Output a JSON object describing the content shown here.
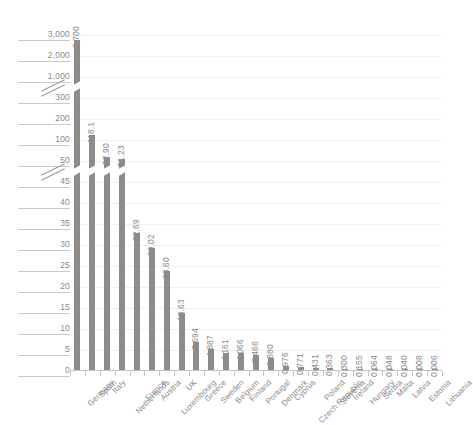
{
  "chart_data": {
    "type": "bar",
    "title": "",
    "subtitle": "",
    "xlabel": "",
    "ylabel": "",
    "grid": true,
    "legend": null,
    "axis_breaks": [
      {
        "between": [
          45,
          50
        ],
        "marker": "double-slash"
      },
      {
        "between": [
          300,
          1000
        ],
        "marker": "double-slash"
      }
    ],
    "ylim": [
      0,
      3000
    ],
    "ytick_labels": [
      "0",
      "5",
      "10",
      "15",
      "20",
      "25",
      "30",
      "35",
      "40",
      "45",
      "50",
      "100",
      "200",
      "300",
      "1,000",
      "2,000",
      "3,000"
    ],
    "ytick_values": [
      0,
      5,
      10,
      15,
      20,
      25,
      30,
      35,
      40,
      45,
      50,
      100,
      200,
      300,
      1000,
      2000,
      3000
    ],
    "categories": [
      "Germany",
      "Spain",
      "Italy",
      "Netherlands",
      "France",
      "Austria",
      "Luxembourg",
      "UK",
      "Greece",
      "Sweden",
      "Belgium",
      "Finland",
      "Portugal",
      "Denmark",
      "Cyprus",
      "Czech Republic",
      "Poland",
      "Slovenia",
      "Ireland",
      "Hungary",
      "Serbia",
      "Malta",
      "Latvia",
      "Estonia",
      "Lithuania"
    ],
    "values": [
      2700,
      118.1,
      57.9,
      51.23,
      32.69,
      29.02,
      23.6,
      13.63,
      6.694,
      4.887,
      4.161,
      4.066,
      3.466,
      2.88,
      0.976,
      0.771,
      0.431,
      0.363,
      0.3,
      0.155,
      0.064,
      0.048,
      0.04,
      0.008,
      0.006
    ],
    "value_labels": [
      "2,700",
      "118.1",
      "57.90",
      "51.23",
      "32.69",
      "29.02",
      "23.60",
      "13.63",
      "6.694",
      "4.887",
      "4.161",
      "4.066",
      "3.466",
      "2.880",
      "0.976",
      "0.771",
      "0.431",
      "0.363",
      "0.300",
      "0.155",
      "0.064",
      "0.048",
      "0.040",
      "0.008",
      "0.006"
    ],
    "colors": {
      "bar": "#8c8c8c",
      "grid": "#f0f0f0",
      "axis": "#c4c4c4",
      "text": "#8a8a8a",
      "background": "#ffffff"
    }
  }
}
